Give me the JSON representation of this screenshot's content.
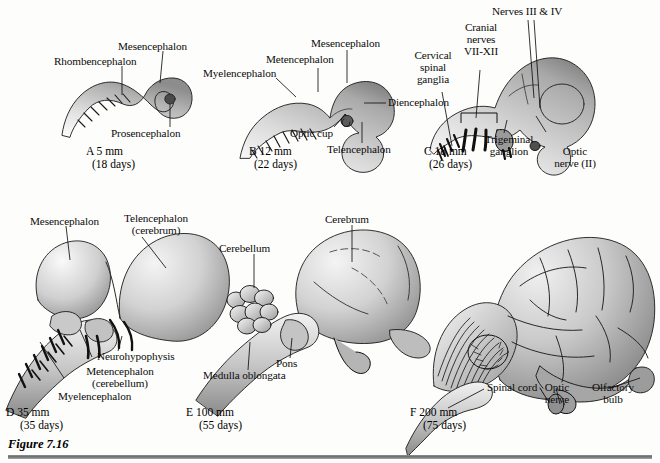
{
  "figure": {
    "caption": "Figure 7.16",
    "background_color": "#fdfdfb",
    "ink_color": "#111111"
  },
  "panels": [
    {
      "id": "A",
      "caption_line1": "A 5 mm",
      "caption_line2": "(18 days)",
      "labels": [
        {
          "name": "rhombencephalon",
          "text": "Rhombencephalon"
        },
        {
          "name": "mesencephalon",
          "text": "Mesencephalon"
        },
        {
          "name": "prosencephalon",
          "text": "Prosencephalon"
        }
      ]
    },
    {
      "id": "B",
      "caption_line1": "B 12 mm",
      "caption_line2": "(22 days)",
      "labels": [
        {
          "name": "myelencephalon",
          "text": "Myelencephalon"
        },
        {
          "name": "metencephalon",
          "text": "Metencephalon"
        },
        {
          "name": "mesencephalon",
          "text": "Mesencephalon"
        },
        {
          "name": "diencephalon",
          "text": "Diencephalon"
        },
        {
          "name": "optic-cup",
          "text": "Optic cup"
        },
        {
          "name": "telencephalon",
          "text": "Telencephalon"
        }
      ]
    },
    {
      "id": "C",
      "caption_line1": "C 18 mm",
      "caption_line2": "(26 days)",
      "labels": [
        {
          "name": "cervical-spinal-ganglia",
          "line1": "Cervical",
          "line2": "spinal",
          "line3": "ganglia"
        },
        {
          "name": "cranial-nerves",
          "line1": "Cranial",
          "line2": "nerves",
          "line3": "VII-XII"
        },
        {
          "name": "nerves-iii-iv",
          "text": "Nerves III & IV"
        },
        {
          "name": "trigeminal-ganglion",
          "line1": "Trigeminal",
          "line2": "ganglion"
        },
        {
          "name": "optic-nerve",
          "line1": "Optic",
          "line2": "nerve (II)"
        }
      ]
    },
    {
      "id": "D",
      "caption_line1": "D 35 mm",
      "caption_line2": "(35 days)",
      "labels": [
        {
          "name": "mesencephalon",
          "text": "Mesencephalon"
        },
        {
          "name": "telencephalon",
          "line1": "Telencephalon",
          "line2": "(cerebrum)"
        },
        {
          "name": "neurohypophysis",
          "text": "Neurohypophysis"
        },
        {
          "name": "metencephalon",
          "line1": "Metencephalon",
          "line2": "(cerebellum)"
        },
        {
          "name": "myelencephalon",
          "text": "Myelencephalon"
        }
      ]
    },
    {
      "id": "E",
      "caption_line1": "E 100 mm",
      "caption_line2": "(55 days)",
      "labels": [
        {
          "name": "cerebellum",
          "text": "Cerebellum"
        },
        {
          "name": "cerebrum",
          "text": "Cerebrum"
        },
        {
          "name": "pons",
          "text": "Pons"
        },
        {
          "name": "medulla-oblongata",
          "text": "Medulla oblongata"
        }
      ]
    },
    {
      "id": "F",
      "caption_line1": "F 200 mm",
      "caption_line2": "(75 days)",
      "labels": [
        {
          "name": "spinal-cord",
          "text": "Spinal cord"
        },
        {
          "name": "optic-nerve",
          "line1": "Optic",
          "line2": "nerve"
        },
        {
          "name": "olfactory-bulb",
          "line1": "Olfactory",
          "line2": "bulb"
        }
      ]
    }
  ]
}
